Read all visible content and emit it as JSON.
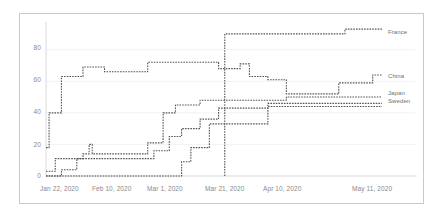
{
  "chart_data": {
    "type": "line",
    "title": "",
    "subtitle": "",
    "xlabel": "",
    "ylabel": "",
    "grid": true,
    "legend_position": "right-inline",
    "xlim": [
      "Jan 22, 2020",
      "May 11, 2020"
    ],
    "ylim": [
      0,
      95
    ],
    "y_ticks": [
      0,
      20,
      40,
      60,
      80
    ],
    "x_ticks": [
      "Jan 22, 2020",
      "Feb 10, 2020",
      "Mar 1, 2020",
      "Mar 21, 2020",
      "Apr 10, 2020",
      "May 11, 2020"
    ],
    "x_tick_days": [
      0,
      19,
      38,
      58,
      78,
      109
    ],
    "total_days": 110,
    "line_style": "dotted-step",
    "line_color": "#555555",
    "series": [
      {
        "name": "France",
        "color": "#555555",
        "label_x": 110,
        "label_y": 92,
        "points": [
          {
            "day": 58,
            "value": 0
          },
          {
            "day": 58,
            "value": 90
          },
          {
            "day": 97,
            "value": 90
          },
          {
            "day": 97,
            "value": 93
          },
          {
            "day": 109,
            "value": 93
          }
        ]
      },
      {
        "name": "China",
        "color": "#555555",
        "label_x": 110,
        "label_y": 62,
        "points": [
          {
            "day": 0,
            "value": 18
          },
          {
            "day": 1,
            "value": 18
          },
          {
            "day": 1,
            "value": 40
          },
          {
            "day": 5,
            "value": 40
          },
          {
            "day": 5,
            "value": 63
          },
          {
            "day": 12,
            "value": 63
          },
          {
            "day": 12,
            "value": 69
          },
          {
            "day": 19,
            "value": 69
          },
          {
            "day": 19,
            "value": 66
          },
          {
            "day": 33,
            "value": 66
          },
          {
            "day": 33,
            "value": 72
          },
          {
            "day": 56,
            "value": 72
          },
          {
            "day": 56,
            "value": 68
          },
          {
            "day": 63,
            "value": 68
          },
          {
            "day": 63,
            "value": 71
          },
          {
            "day": 66,
            "value": 71
          },
          {
            "day": 66,
            "value": 63
          },
          {
            "day": 72,
            "value": 63
          },
          {
            "day": 72,
            "value": 61
          },
          {
            "day": 78,
            "value": 61
          },
          {
            "day": 78,
            "value": 52
          },
          {
            "day": 95,
            "value": 52
          },
          {
            "day": 95,
            "value": 59
          },
          {
            "day": 106,
            "value": 59
          },
          {
            "day": 106,
            "value": 64
          },
          {
            "day": 109,
            "value": 64
          }
        ]
      },
      {
        "name": "Japan",
        "color": "#555555",
        "label_x": 110,
        "label_y": 52,
        "points": [
          {
            "day": 0,
            "value": 3
          },
          {
            "day": 3,
            "value": 3
          },
          {
            "day": 3,
            "value": 11
          },
          {
            "day": 12,
            "value": 11
          },
          {
            "day": 12,
            "value": 14
          },
          {
            "day": 14,
            "value": 14
          },
          {
            "day": 14,
            "value": 20
          },
          {
            "day": 15,
            "value": 20
          },
          {
            "day": 15,
            "value": 14
          },
          {
            "day": 33,
            "value": 14
          },
          {
            "day": 33,
            "value": 21
          },
          {
            "day": 38,
            "value": 21
          },
          {
            "day": 38,
            "value": 40
          },
          {
            "day": 42,
            "value": 40
          },
          {
            "day": 42,
            "value": 45
          },
          {
            "day": 50,
            "value": 45
          },
          {
            "day": 50,
            "value": 48
          },
          {
            "day": 78,
            "value": 48
          },
          {
            "day": 78,
            "value": 50
          },
          {
            "day": 109,
            "value": 50
          }
        ]
      },
      {
        "name": "Sweden",
        "color": "#555555",
        "label_x": 110,
        "label_y": 46,
        "points": [
          {
            "day": 0,
            "value": 0
          },
          {
            "day": 5,
            "value": 0
          },
          {
            "day": 5,
            "value": 4
          },
          {
            "day": 10,
            "value": 4
          },
          {
            "day": 10,
            "value": 11
          },
          {
            "day": 35,
            "value": 11
          },
          {
            "day": 35,
            "value": 16
          },
          {
            "day": 40,
            "value": 16
          },
          {
            "day": 40,
            "value": 25
          },
          {
            "day": 44,
            "value": 25
          },
          {
            "day": 44,
            "value": 30
          },
          {
            "day": 50,
            "value": 30
          },
          {
            "day": 50,
            "value": 36
          },
          {
            "day": 56,
            "value": 36
          },
          {
            "day": 56,
            "value": 43
          },
          {
            "day": 72,
            "value": 43
          },
          {
            "day": 72,
            "value": 46
          },
          {
            "day": 109,
            "value": 46
          }
        ]
      },
      {
        "name": "Baseline",
        "color": "#555555",
        "label_x": null,
        "label_y": null,
        "points": [
          {
            "day": 0,
            "value": 0
          },
          {
            "day": 44,
            "value": 0
          },
          {
            "day": 44,
            "value": 9
          },
          {
            "day": 47,
            "value": 9
          },
          {
            "day": 47,
            "value": 18
          },
          {
            "day": 53,
            "value": 18
          },
          {
            "day": 53,
            "value": 33
          },
          {
            "day": 72,
            "value": 33
          },
          {
            "day": 72,
            "value": 44
          },
          {
            "day": 109,
            "value": 44
          }
        ]
      }
    ]
  },
  "axis": {
    "y_tick_labels": [
      "80",
      "60",
      "40",
      "20",
      "0"
    ],
    "x_tick_labels": [
      "Jan 22, 2020",
      "Feb 10, 2020",
      "Mar 1, 2020",
      "Mar 21, 2020",
      "Apr 10, 2020",
      "May 11, 2020"
    ]
  },
  "legend": {
    "items": [
      {
        "label": "France"
      },
      {
        "label": "China"
      },
      {
        "label": "Japan"
      },
      {
        "label": "Sweden"
      }
    ]
  }
}
